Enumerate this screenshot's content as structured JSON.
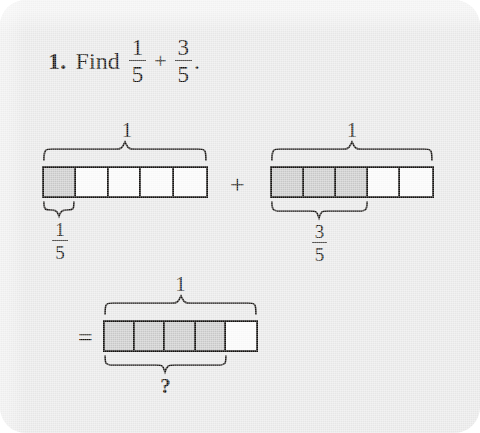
{
  "page": {
    "background_color": "#e9e9e9",
    "ink_color": "#14120f",
    "shaded_cell_color": "#c9c9c9",
    "unshaded_cell_color": "#fbfbfb"
  },
  "header": {
    "number": "1.",
    "verb": "Find",
    "operator": "+",
    "terminator": ".",
    "first_fraction": {
      "numerator": "1",
      "denominator": "5"
    },
    "second_fraction": {
      "numerator": "3",
      "denominator": "5"
    }
  },
  "operators": {
    "plus": "+",
    "equals": "="
  },
  "models": [
    {
      "id": "first-addend",
      "total_cells": 5,
      "shaded_cells": 1,
      "whole_label": "1",
      "part_label": {
        "numerator": "1",
        "denominator": "5"
      },
      "part_label_text": "1/5"
    },
    {
      "id": "second-addend",
      "total_cells": 5,
      "shaded_cells": 3,
      "whole_label": "1",
      "part_label": {
        "numerator": "3",
        "denominator": "5"
      },
      "part_label_text": "3/5"
    },
    {
      "id": "sum",
      "total_cells": 5,
      "shaded_cells": 4,
      "whole_label": "1",
      "part_label_text": "?"
    }
  ]
}
